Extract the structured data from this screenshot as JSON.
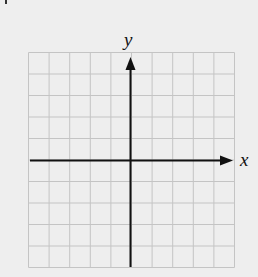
{
  "figure": {
    "type": "cartesian-coordinate-grid",
    "grid": {
      "columns": 10,
      "rows": 10,
      "line_color": "#c4c4c4",
      "background": "#eeeeee"
    },
    "axes": {
      "x_label": "x",
      "y_label": "y",
      "color": "#111111",
      "x_arrow": "right",
      "y_arrow": "up"
    },
    "corner_mark": "1"
  }
}
